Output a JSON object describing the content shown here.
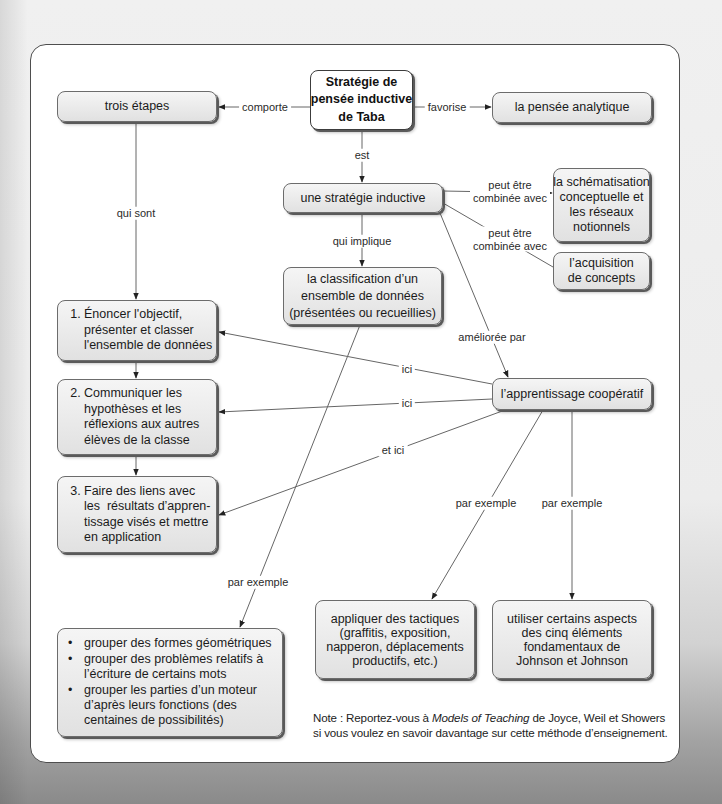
{
  "diagram": {
    "nodes": {
      "taba": {
        "lines": [
          "Stratégie de",
          "pensée inductive",
          "de Taba"
        ]
      },
      "trois_etapes": {
        "lines": [
          "trois étapes"
        ]
      },
      "pensee_analytique": {
        "lines": [
          "la pensée analytique"
        ]
      },
      "strategie_inductive": {
        "lines": [
          "une stratégie inductive"
        ]
      },
      "schematisation": {
        "lines": [
          "la schématisation",
          "conceptuelle et",
          "les réseaux",
          "notionnels"
        ]
      },
      "acquisition": {
        "lines": [
          "l’acquisition",
          "de concepts"
        ]
      },
      "classification": {
        "lines": [
          "la classification d’un",
          "ensemble de données",
          "(présentées ou recueillies)"
        ]
      },
      "step1": {
        "number": "1.",
        "lines": [
          "Énoncer l'objectif,",
          "présenter et classer",
          "l'ensemble de données"
        ]
      },
      "step2": {
        "number": "2.",
        "lines": [
          "Communiquer les",
          "hypothèses et les",
          "réflexions aux autres",
          "élèves de la classe"
        ]
      },
      "step3": {
        "number": "3.",
        "lines": [
          "Faire des liens avec",
          "les  résultats d’appren-",
          "tissage visés et mettre",
          "en application"
        ]
      },
      "apprentissage_cooperatif": {
        "lines": [
          "l’apprentissage coopératif"
        ]
      },
      "tactiques": {
        "lines": [
          "appliquer des tactiques",
          "(graffitis, exposition,",
          "napperon, déplacements",
          "productifs, etc.)"
        ]
      },
      "johnson": {
        "lines": [
          "utiliser certains aspects",
          "des cinq éléments",
          "fondamentaux de",
          "Johnson et Johnson"
        ]
      },
      "exemples": {
        "bullet_glyph": "•",
        "bullets": [
          {
            "lines": [
              "grouper des formes géométriques"
            ]
          },
          {
            "lines": [
              "grouper des problèmes relatifs à",
              "l’écriture de certains mots"
            ]
          },
          {
            "lines": [
              "grouper les parties d’un moteur",
              "d’après leurs fonctions (des",
              "centaines de possibilités)"
            ]
          }
        ]
      }
    },
    "edges": [
      {
        "from": "taba",
        "to": "trois_etapes",
        "label": [
          "comporte"
        ]
      },
      {
        "from": "taba",
        "to": "pensee_analytique",
        "label": [
          "favorise"
        ]
      },
      {
        "from": "taba",
        "to": "strategie_inductive",
        "label": [
          "est"
        ]
      },
      {
        "from": "trois_etapes",
        "to": "step1",
        "label": [
          "qui sont"
        ]
      },
      {
        "from": "strategie_inductive",
        "to": "schematisation",
        "label": [
          "peut être",
          "combinée avec"
        ]
      },
      {
        "from": "strategie_inductive",
        "to": "acquisition",
        "label": [
          "peut être",
          "combinée avec"
        ]
      },
      {
        "from": "strategie_inductive",
        "to": "classification",
        "label": [
          "qui implique"
        ]
      },
      {
        "from": "strategie_inductive",
        "to": "apprentissage_cooperatif",
        "label": [
          "améliorée par"
        ]
      },
      {
        "from": "apprentissage_cooperatif",
        "to": "step1",
        "label": [
          "ici"
        ]
      },
      {
        "from": "apprentissage_cooperatif",
        "to": "step2",
        "label": [
          "ici"
        ]
      },
      {
        "from": "apprentissage_cooperatif",
        "to": "step3",
        "label": [
          "et ici"
        ]
      },
      {
        "from": "apprentissage_cooperatif",
        "to": "tactiques",
        "label": [
          "par exemple"
        ]
      },
      {
        "from": "apprentissage_cooperatif",
        "to": "johnson",
        "label": [
          "par exemple"
        ]
      },
      {
        "from": "classification",
        "to": "exemples",
        "label": [
          "par exemple"
        ]
      },
      {
        "from": "step1",
        "to": "step2",
        "label": []
      },
      {
        "from": "step2",
        "to": "step3",
        "label": []
      }
    ]
  },
  "note": {
    "prefix": "Note : Reportez-vous à ",
    "title": "Models of Teaching",
    "suffix": " de Joyce, Weil et Showers",
    "line2": "si vous voulez en savoir davantage sur cette méthode d’enseignement."
  },
  "colors": {
    "frame_border": "#4e4e4e",
    "node_fill": "#e9e9e9",
    "node_border": "#6c6c6c",
    "root_fill": "#ffffff",
    "edge_line": "#666666",
    "arrow": "#222222"
  }
}
